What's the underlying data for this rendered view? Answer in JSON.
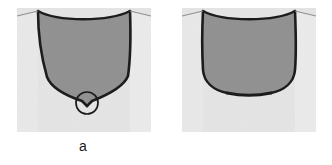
{
  "figure": {
    "background_color": "#ffffff",
    "width": 332,
    "height": 165,
    "panels": [
      {
        "id": "a",
        "caption": "a",
        "description": "Cross section with sharply pointed V-shaped root and circular annotation marking the root tip",
        "annotation": {
          "shape": "circle",
          "label": "root-detail-circle",
          "center_x": 87,
          "center_y": 103,
          "radius": 11,
          "stroke_color": "#1c1c1c"
        },
        "region_x": 17,
        "region_y": 8,
        "region_width": 134,
        "region_height": 124,
        "base_color": "#e4e4e4",
        "fill_color": "#919191",
        "outline_color": "#1c1c1c"
      },
      {
        "id": "b",
        "caption": "b",
        "description": "Cross section with broad rounded U-shaped root and no annotation",
        "annotation": null,
        "region_x": 182,
        "region_y": 8,
        "region_width": 134,
        "region_height": 124,
        "base_color": "#e4e4e4",
        "fill_color": "#919191",
        "outline_color": "#1c1c1c"
      }
    ],
    "colors": {
      "background": "#ffffff",
      "substrate_light_gray": "#e4e4e4",
      "bead_dark_gray": "#919191",
      "outline_black": "#1c1c1c",
      "caption_text": "#1a1a1a"
    }
  }
}
